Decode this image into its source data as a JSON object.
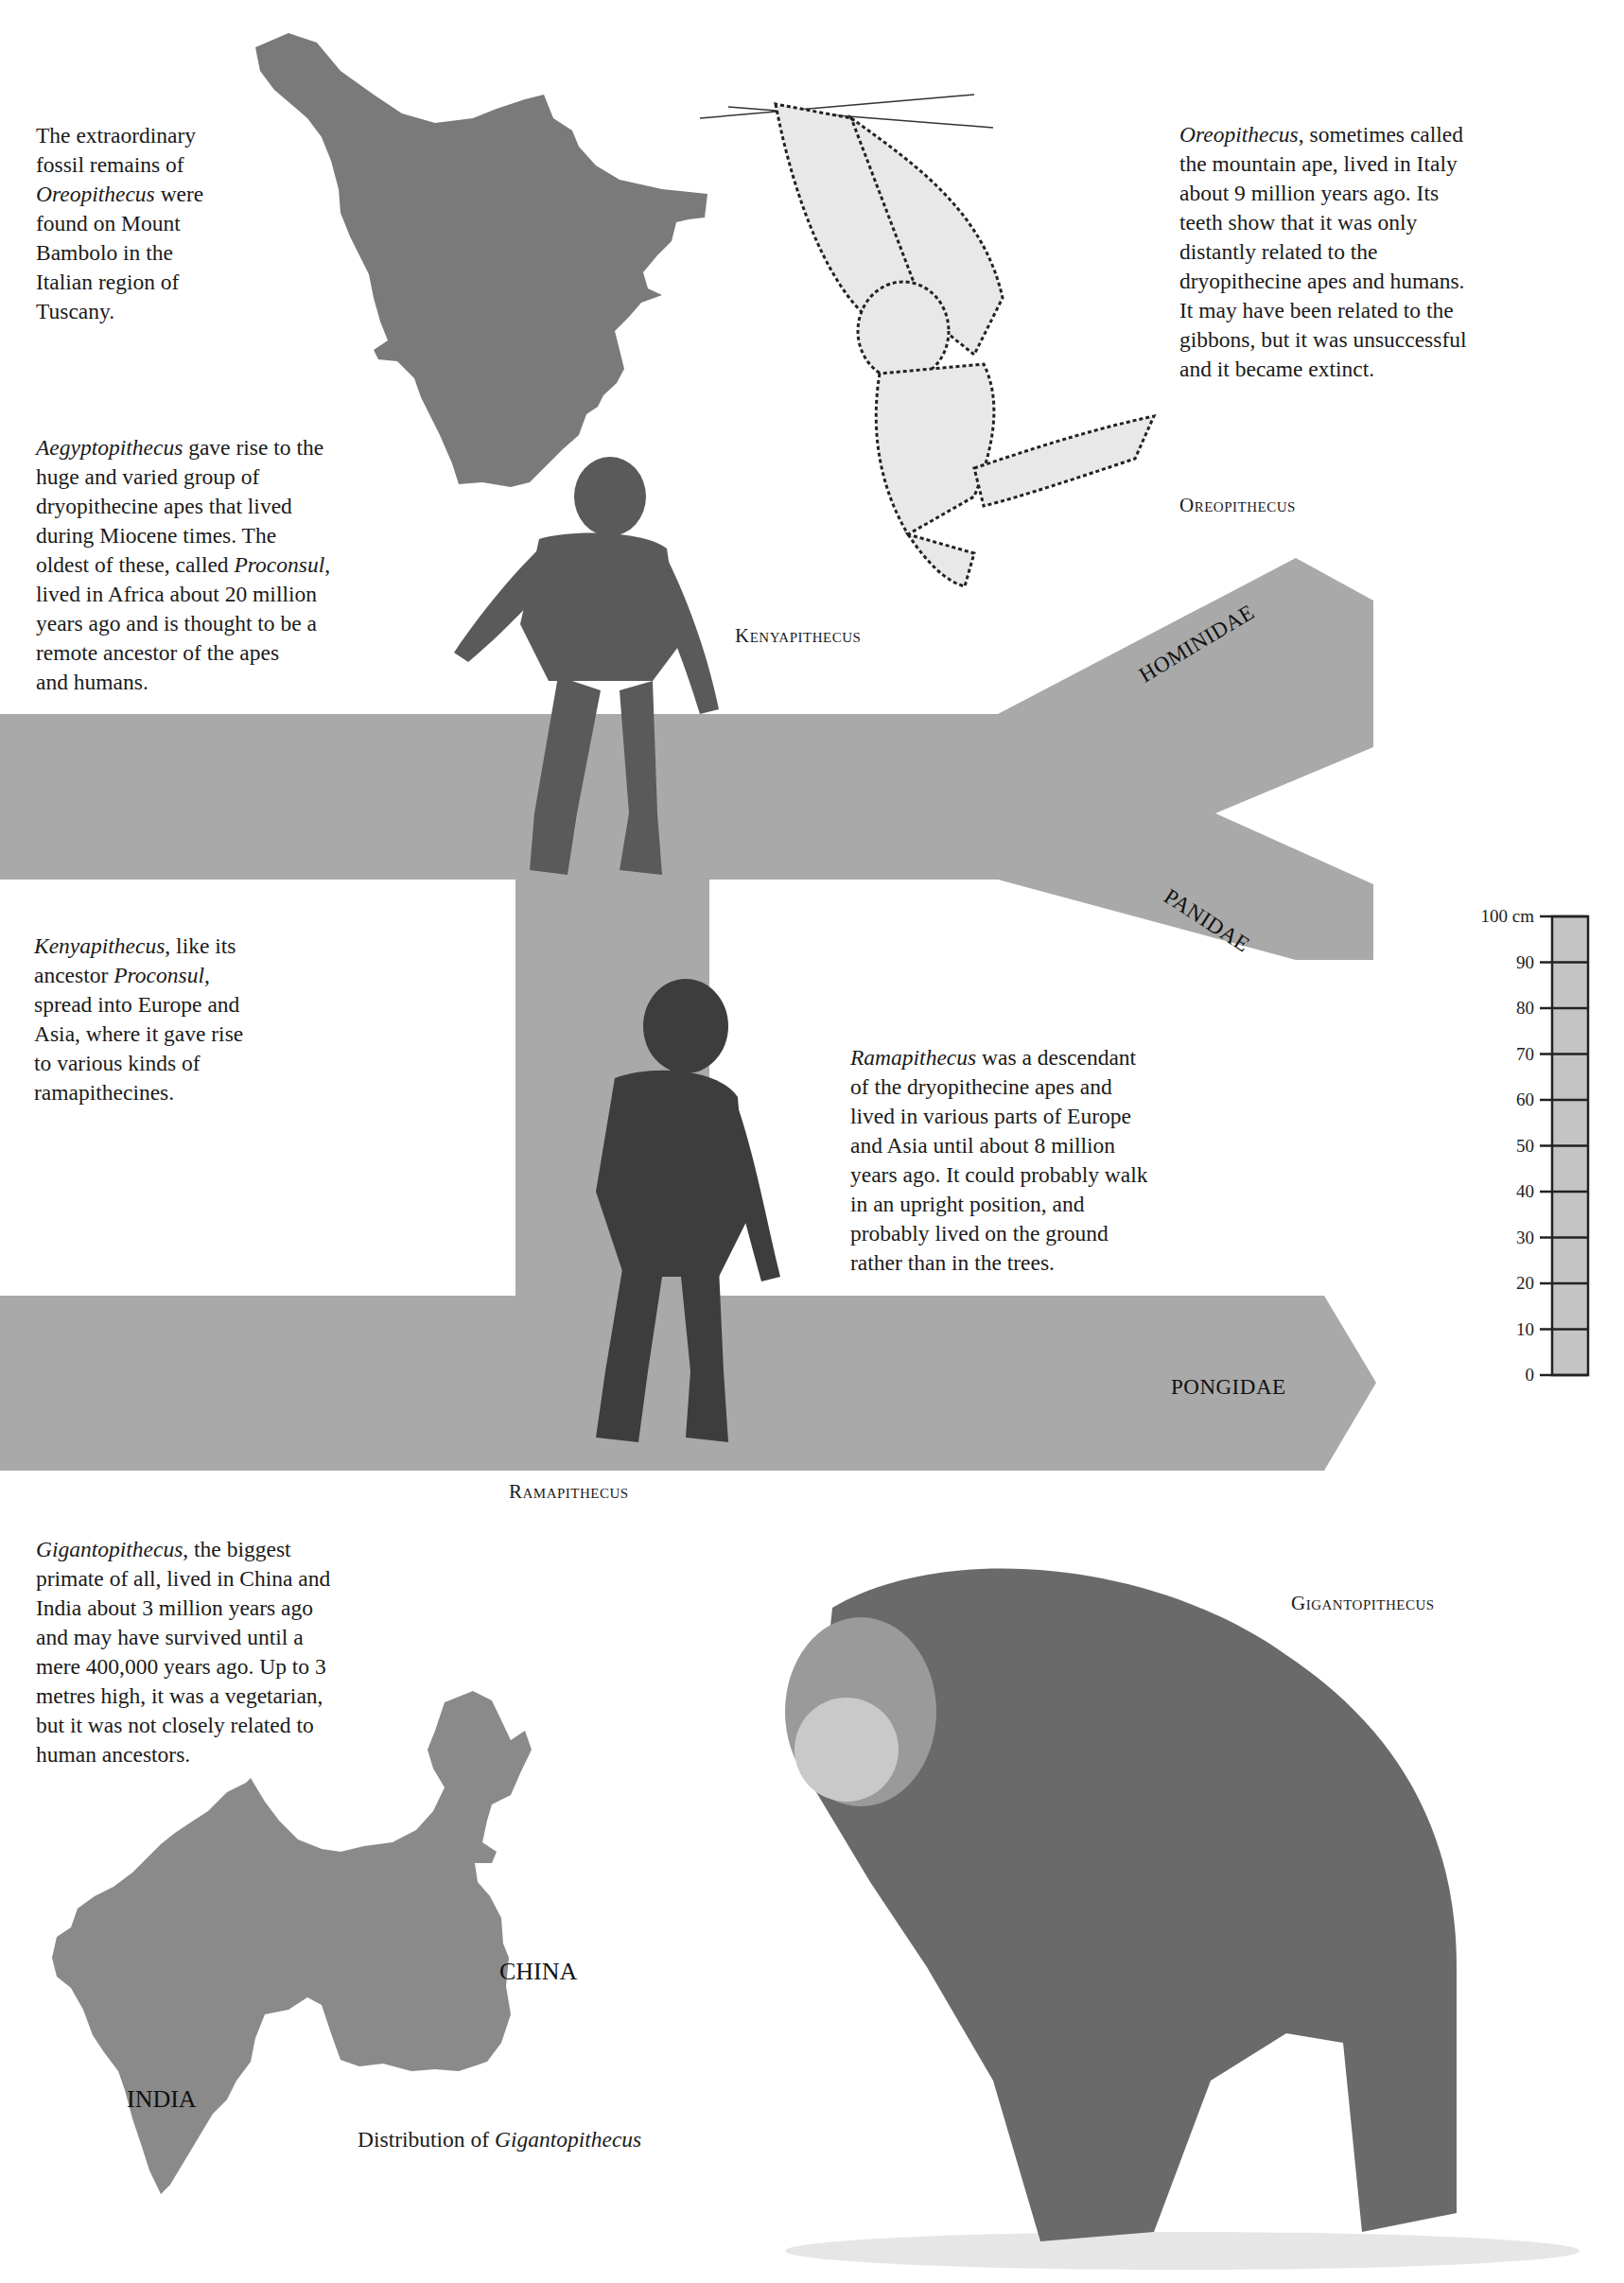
{
  "texts": {
    "tuscany_note": {
      "lines": [
        "The extraordinary",
        "fossil remains of",
        "§Oreopithecus§ were",
        "found on Mount",
        "Bambolo in the",
        "Italian region of",
        "Tuscany."
      ]
    },
    "oreopithecus_note": {
      "lines": [
        "§Oreopithecus§, sometimes called",
        "the mountain ape, lived in Italy",
        "about 9 million years ago. Its",
        "teeth show that it was only",
        "distantly related to the",
        "dryopithecine apes and humans.",
        "It may have been related to the",
        "gibbons, but it was unsuccessful",
        "and it became extinct."
      ]
    },
    "aegyptopithecus_note": {
      "lines": [
        "§Aegyptopithecus§ gave rise to the",
        "huge and varied group of",
        "dryopithecine apes that lived",
        "during Miocene times. The",
        "oldest of these, called §Proconsul§,",
        "lived in Africa about 20 million",
        "years ago and is thought to be a",
        "remote ancestor of the apes",
        "and humans."
      ]
    },
    "kenyapithecus_note": {
      "lines": [
        "§Kenyapithecus§, like its",
        "ancestor §Proconsul§,",
        "spread into Europe and",
        "Asia, where it gave rise",
        "to various kinds of",
        "ramapithecines."
      ]
    },
    "ramapithecus_note": {
      "lines": [
        "§Ramapithecus§ was a descendant",
        "of the dryopithecine apes and",
        "lived in various parts of Europe",
        "and Asia until about 8 million",
        "years ago. It could probably walk",
        "in an upright position, and",
        "probably lived on the ground",
        "rather than in the trees."
      ]
    },
    "gigantopithecus_note": {
      "lines": [
        "§Gigantopithecus§, the biggest",
        "primate of all, lived in China and",
        "India about 3 million years ago",
        "and may have survived until a",
        "mere 400,000 years ago. Up to 3",
        "metres high, it was a vegetarian,",
        "but it was not closely related to",
        "human ancestors."
      ]
    }
  },
  "captions": {
    "oreopithecus": "Oreopithecus",
    "kenyapithecus": "Kenyapithecus",
    "ramapithecus": "Ramapithecus",
    "gigantopithecus": "Gigantopithecus"
  },
  "tree": {
    "fill_color": "#a9a9a9",
    "branches": {
      "hominidae": "HOMINIDAE",
      "panidae": "PANIDAE",
      "pongidae": "PONGIDAE"
    }
  },
  "maps": {
    "tuscany": {
      "fill_color": "#7a7a7a"
    },
    "asia": {
      "fill_color": "#8a8a8a",
      "labels": {
        "china": "CHINA",
        "india": "INDIA"
      },
      "caption_prefix": "Distribution of ",
      "caption_italic": "Gigantopithecus"
    }
  },
  "scale_bar": {
    "unit": "cm",
    "top_label": "100 cm",
    "ticks": [
      "90",
      "80",
      "70",
      "60",
      "50",
      "40",
      "30",
      "20",
      "10",
      "0"
    ],
    "fill_color": "#c4c4c4"
  },
  "illustrations": {
    "oreopithecus": "oreopithecus-illustration",
    "kenyapithecus": "kenyapithecus-illustration",
    "ramapithecus": "ramapithecus-illustration",
    "gigantopithecus": "gigantopithecus-illustration"
  }
}
